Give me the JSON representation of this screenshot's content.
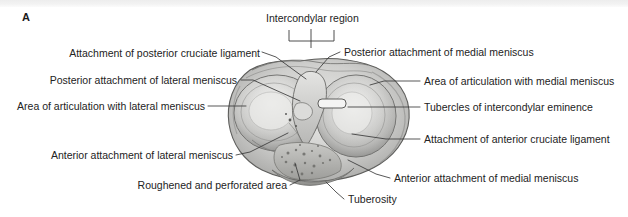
{
  "figure": {
    "panel_letter": "A",
    "background_color": "#ffffff",
    "line_color": "#3a3a3a",
    "text_color": "#232323"
  },
  "bracket_label": {
    "text": "Intercondylar region"
  },
  "labels_left": [
    {
      "id": "posterior-cruciate-ligament-attachment",
      "text": "Attachment of posterior cruciate ligament"
    },
    {
      "id": "posterior-attachment-lateral-meniscus",
      "text": "Posterior attachment of lateral meniscus"
    },
    {
      "id": "area-articulation-lateral-meniscus",
      "text": "Area of articulation with lateral meniscus"
    },
    {
      "id": "anterior-attachment-lateral-meniscus",
      "text": "Anterior attachment of lateral meniscus"
    },
    {
      "id": "roughened-perforated-area",
      "text": "Roughened and perforated area"
    }
  ],
  "labels_right": [
    {
      "id": "posterior-attachment-medial-meniscus",
      "text": "Posterior attachment of medial meniscus"
    },
    {
      "id": "area-articulation-medial-meniscus",
      "text": "Area of articulation with medial meniscus"
    },
    {
      "id": "tubercles-intercondylar-eminence",
      "text": "Tubercles of intercondylar eminence"
    },
    {
      "id": "anterior-cruciate-ligament-attachment",
      "text": "Attachment of anterior cruciate ligament"
    },
    {
      "id": "anterior-attachment-medial-meniscus",
      "text": "Anterior attachment of medial meniscus"
    }
  ],
  "labels_bottom": [
    {
      "id": "tuberosity",
      "text": "Tuberosity"
    }
  ]
}
